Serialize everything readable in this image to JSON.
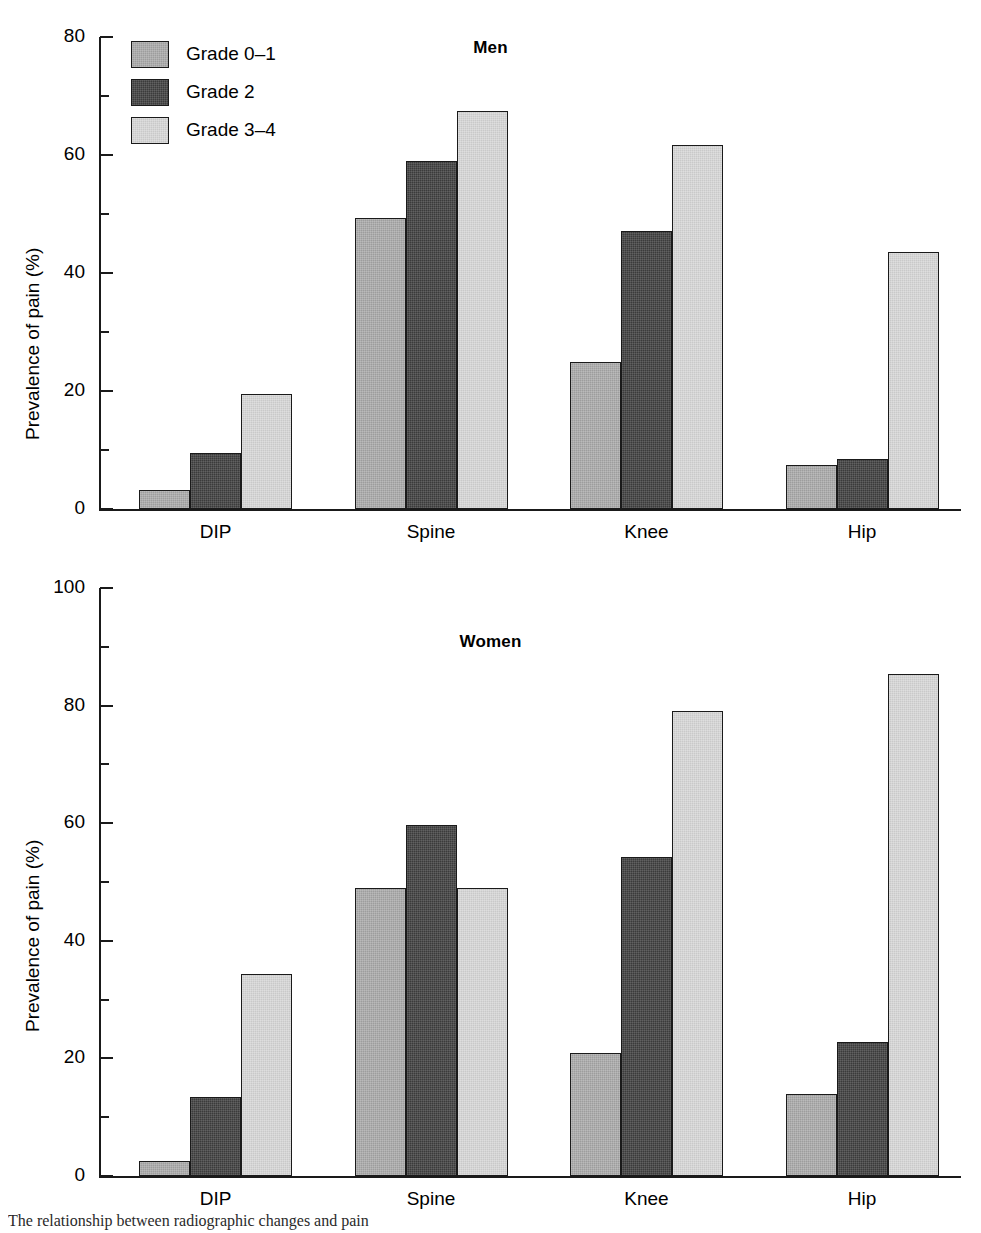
{
  "figure": {
    "caption_fragment": "The relationship between radiographic changes and pain"
  },
  "legend": {
    "position": "top-left-inside-first-panel",
    "entries": [
      {
        "label": "Grade 0–1",
        "color": "#9d9d9d"
      },
      {
        "label": "Grade 2",
        "color": "#3b3b3b"
      },
      {
        "label": "Grade 3–4",
        "color": "#c9c9c9"
      }
    ]
  },
  "chart_data": [
    {
      "type": "bar",
      "title": "Men",
      "xlabel": "",
      "ylabel": "Prevalence of pain (%)",
      "categories": [
        "DIP",
        "Spine",
        "Knee",
        "Hip"
      ],
      "ylim": [
        0,
        80
      ],
      "yticks": [
        0,
        20,
        40,
        60,
        80
      ],
      "ytick_labels": [
        "0",
        "20",
        "40",
        "60",
        "80"
      ],
      "yminor_ticks": [
        10,
        30,
        50,
        70
      ],
      "grid": false,
      "legend_position": "upper left",
      "series": [
        {
          "name": "Grade 0–1",
          "color": "#9d9d9d",
          "values": [
            3.3,
            49.3,
            24.9,
            7.4
          ]
        },
        {
          "name": "Grade 2",
          "color": "#3b3b3b",
          "values": [
            9.5,
            58.9,
            47.1,
            8.5
          ]
        },
        {
          "name": "Grade 3–4",
          "color": "#c9c9c9",
          "values": [
            19.5,
            67.4,
            61.7,
            43.5
          ]
        }
      ]
    },
    {
      "type": "bar",
      "title": "Women",
      "xlabel": "",
      "ylabel": "Prevalence of pain (%)",
      "categories": [
        "DIP",
        "Spine",
        "Knee",
        "Hip"
      ],
      "ylim": [
        0,
        100
      ],
      "yticks": [
        0,
        20,
        40,
        60,
        80,
        100
      ],
      "ytick_labels": [
        "0",
        "20",
        "40",
        "60",
        "80",
        "100"
      ],
      "yminor_ticks": [
        10,
        30,
        50,
        70,
        90
      ],
      "grid": false,
      "legend_position": "none",
      "series": [
        {
          "name": "Grade 0–1",
          "color": "#9d9d9d",
          "values": [
            2.6,
            49.0,
            20.9,
            13.9
          ]
        },
        {
          "name": "Grade 2",
          "color": "#3b3b3b",
          "values": [
            13.4,
            59.7,
            54.3,
            22.8
          ]
        },
        {
          "name": "Grade 3–4",
          "color": "#c9c9c9",
          "values": [
            34.3,
            49.0,
            79.0,
            85.4
          ]
        }
      ]
    }
  ]
}
